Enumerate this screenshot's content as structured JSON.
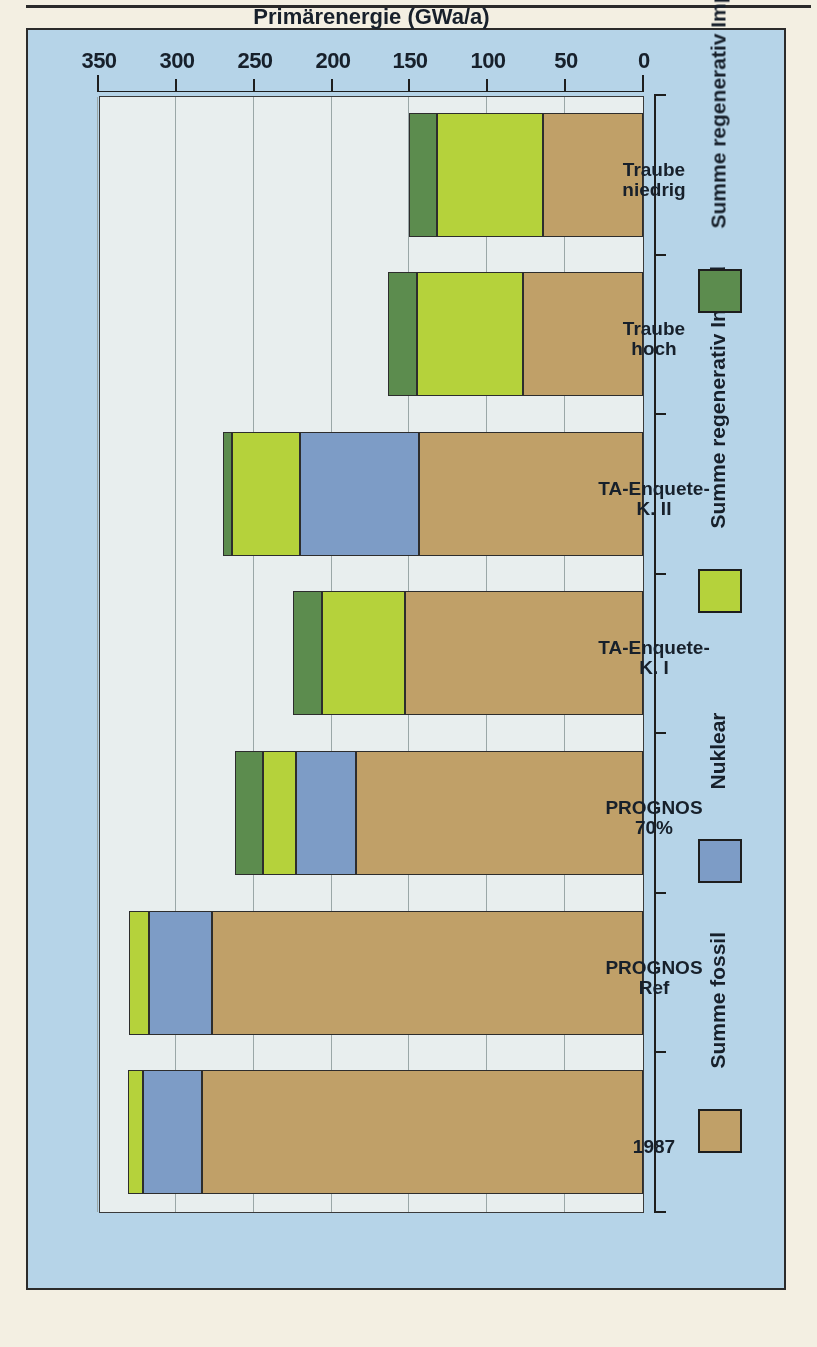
{
  "figure": {
    "background_color": "#b6d4e8",
    "plot_background_color": "#e8eeee",
    "orientation_note": "rotated-180"
  },
  "chart_data": {
    "type": "bar",
    "orientation": "horizontal-stacked",
    "title": "",
    "xlabel": "",
    "ylabel": "Primärenergie (GWa/a)",
    "value_axis_title": "Primärenergie (GWa/a)",
    "value_axis_ticks": [
      0,
      50,
      100,
      150,
      200,
      250,
      300,
      350
    ],
    "value_axis_tick_labels": [
      "0",
      "50",
      "100",
      "150",
      "200",
      "250",
      "300",
      "350"
    ],
    "ylim": [
      0,
      350
    ],
    "grid": true,
    "legend_position": "bottom",
    "categories": [
      "1987",
      "PROGNOS Ref",
      "PROGNOS 70%",
      "TA-Enquete- K. I",
      "TA-Enquete- K. II",
      "Traube hoch",
      "Traube niedrig"
    ],
    "category_labels": [
      {
        "line1": "1987",
        "line2": ""
      },
      {
        "line1": "PROGNOS",
        "line2": "Ref"
      },
      {
        "line1": "PROGNOS",
        "line2": "70%"
      },
      {
        "line1": "TA-Enquete-",
        "line2": "K. I"
      },
      {
        "line1": "TA-Enquete-",
        "line2": "K. II"
      },
      {
        "line1": "Traube",
        "line2": "hoch"
      },
      {
        "line1": "Traube",
        "line2": "niedrig"
      }
    ],
    "series": [
      {
        "name": "Summe fossil",
        "color": "#c0a068",
        "values": [
          283,
          277,
          184,
          153,
          144,
          77,
          64
        ]
      },
      {
        "name": "Nuklear",
        "color": "#7d9cc6",
        "values": [
          38,
          40,
          39,
          0,
          76,
          0,
          0
        ]
      },
      {
        "name": "Summe regenerativ Inland",
        "color": "#b5d23b",
        "values": [
          10,
          13,
          21,
          53,
          44,
          68,
          68
        ]
      },
      {
        "name": "Summe regenerativ Import",
        "color": "#5c8c4e",
        "values": [
          0,
          0,
          18,
          19,
          6,
          19,
          18
        ]
      }
    ],
    "totals": [
      331,
      330,
      262,
      225,
      270,
      164,
      150
    ],
    "legend": [
      {
        "label": "Summe fossil",
        "color": "#c0a068"
      },
      {
        "label": "Nuklear",
        "color": "#7d9cc6"
      },
      {
        "label": "Summe regenerativ Inland",
        "color": "#b5d23b"
      },
      {
        "label": "Summe regenerativ Import",
        "color": "#5c8c4e"
      }
    ]
  }
}
